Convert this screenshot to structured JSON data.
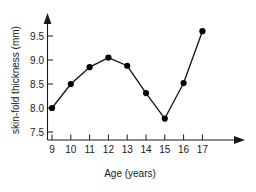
{
  "chart_data": {
    "type": "line",
    "title": "",
    "subtitle": "",
    "xlabel": "Age (years)",
    "ylabel": "skin-fold thickness (mm)",
    "x": [
      9,
      10,
      11,
      12,
      13,
      14,
      15,
      16,
      17
    ],
    "categories": [
      "9",
      "10",
      "11",
      "12",
      "13",
      "14",
      "15",
      "16",
      "17"
    ],
    "values": [
      8.0,
      8.5,
      8.85,
      9.05,
      8.88,
      8.31,
      7.78,
      8.52,
      9.6
    ],
    "series": [
      {
        "name": "skin-fold thickness",
        "values": [
          8.0,
          8.5,
          8.85,
          9.05,
          8.88,
          8.31,
          7.78,
          8.52,
          9.6
        ]
      }
    ],
    "xlim": [
      8.6,
      17.8
    ],
    "ylim": [
      7.5,
      9.8
    ],
    "xticks": [
      9,
      10,
      11,
      12,
      13,
      14,
      15,
      16,
      17
    ],
    "xtick_labels": [
      "9",
      "10",
      "11",
      "12",
      "13",
      "14",
      "15",
      "16",
      "17"
    ],
    "yticks": [
      7.5,
      8.0,
      8.5,
      9.0,
      9.5
    ],
    "ytick_labels": [
      "7.5",
      "8.0",
      "8.5",
      "9.0",
      "9.5"
    ],
    "grid": false,
    "legend": false,
    "legend_position": "none",
    "marker": "filled-circle",
    "line_color": "#111111",
    "marker_color": "#000000",
    "axis_color": "#1a1a1a",
    "background_color": "#ffffff",
    "x_axis_arrow": true,
    "y_axis_arrow": true
  }
}
